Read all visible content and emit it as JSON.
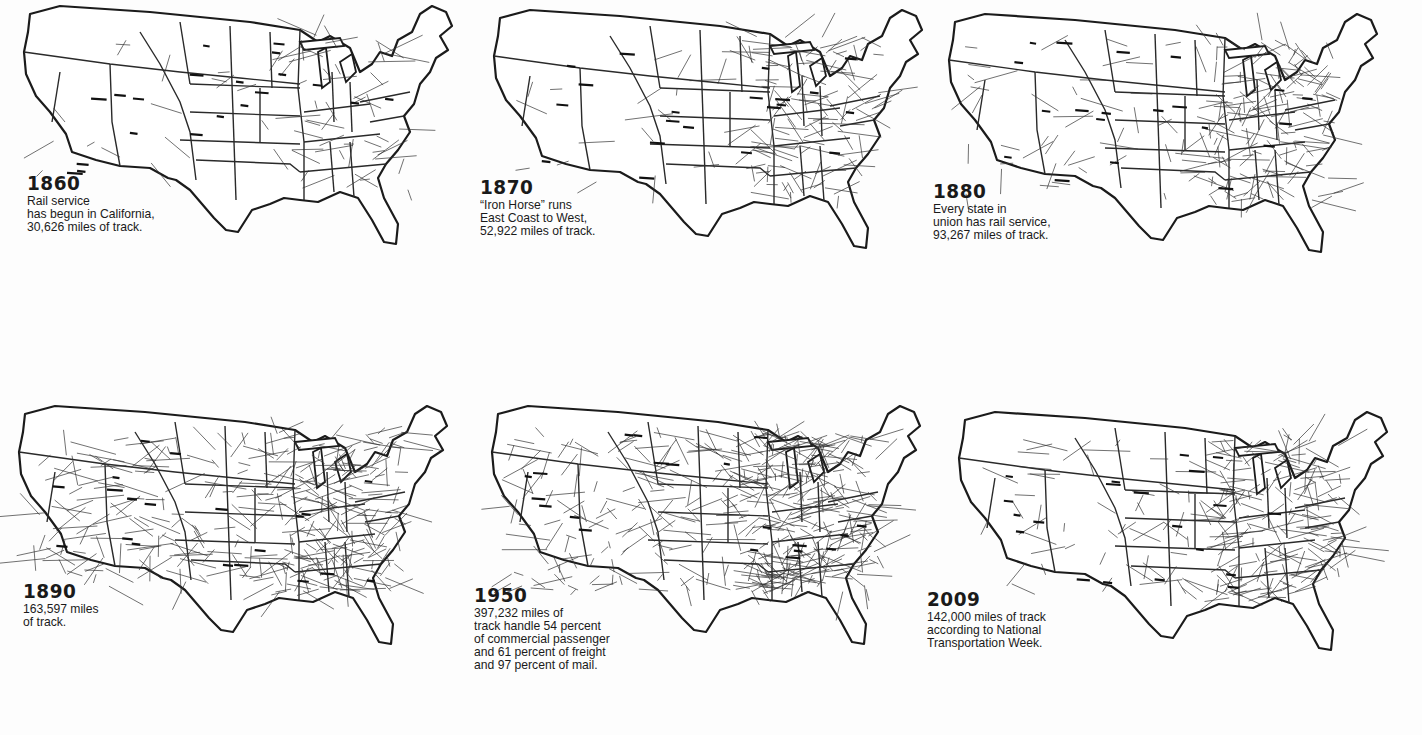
{
  "panels": [
    {
      "year": "1860",
      "caption_lines": [
        "Rail service",
        "has begun in California,",
        "30,626 miles of track."
      ],
      "miles_of_track": 30626
    },
    {
      "year": "1870",
      "caption_lines": [
        "“Iron Horse” runs",
        "East Coast to West,",
        "52,922 miles of track."
      ],
      "miles_of_track": 52922
    },
    {
      "year": "1880",
      "caption_lines": [
        "Every state in",
        "union has rail service,",
        "93,267 miles of track."
      ],
      "miles_of_track": 93267
    },
    {
      "year": "1890",
      "caption_lines": [
        "163,597 miles",
        "of track."
      ],
      "miles_of_track": 163597
    },
    {
      "year": "1950",
      "caption_lines": [
        "397,232 miles of",
        "track handle 54 percent",
        "of commercial passenger",
        "and 61 percent of freight",
        "and 97 percent of mail."
      ],
      "miles_of_track": 397232
    },
    {
      "year": "2009",
      "caption_lines": [
        "142,000 miles of track",
        "according to National",
        "Transportation Week."
      ],
      "miles_of_track": 142000
    }
  ],
  "colors": {
    "background": "#fdfdfd",
    "ink": "#1b1b1b"
  }
}
